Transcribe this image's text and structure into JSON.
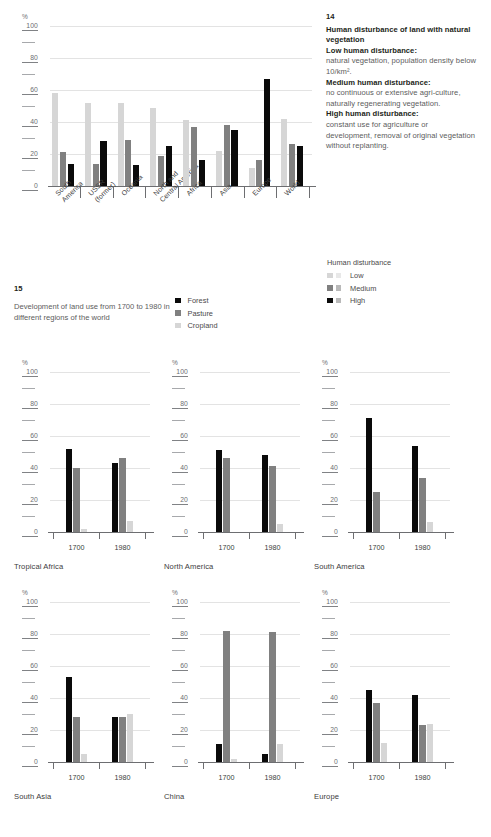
{
  "figure14": {
    "number": "14",
    "title": "Human disturbance of land with natural vegetation",
    "defs": [
      {
        "term": "Low human disturbance:",
        "text": "natural vegetation, population density below 10/km²."
      },
      {
        "term": "Medium human disturbance:",
        "text": "no continuous or extensive agri-culture, naturally regenerating vegetation."
      },
      {
        "term": "High human disturbance:",
        "text": "constant use for agriculture or development, removal of original vegetation without replanting."
      }
    ],
    "legend": {
      "title": "Human disturbance",
      "items": [
        {
          "label": "Low",
          "color": "#d6d6d6"
        },
        {
          "label": "Medium",
          "color": "#808080"
        },
        {
          "label": "High",
          "color": "#0a0a0a"
        }
      ]
    }
  },
  "figure15": {
    "number": "15",
    "caption": "Development of land use from 1700 to 1980 in different regions of the world",
    "legend": {
      "items": [
        {
          "label": "Forest",
          "color": "#0a0a0a"
        },
        {
          "label": "Pasture",
          "color": "#808080"
        },
        {
          "label": "Cropland",
          "color": "#d6d6d6"
        }
      ]
    }
  },
  "axis": {
    "unit": "%",
    "major_ticks": [
      "0",
      "20",
      "40",
      "60",
      "80",
      "100"
    ],
    "minor_ticks": [
      "10",
      "30",
      "50",
      "70",
      "90"
    ],
    "ylim": [
      0,
      100
    ]
  },
  "chart_data": [
    {
      "type": "bar",
      "id": "human-disturbance",
      "title": "Human disturbance of land with natural vegetation",
      "xlabel": "",
      "ylabel": "%",
      "ylim": [
        0,
        100
      ],
      "grid": true,
      "legend_position": "right",
      "categories": [
        "South America",
        "USSR (former)",
        "Oceania",
        "North and Central America",
        "Africa",
        "Asia",
        "Europe",
        "World"
      ],
      "series": [
        {
          "name": "Low",
          "color": "#d6d6d6",
          "values": [
            58,
            52,
            52,
            49,
            41,
            22,
            11,
            42
          ]
        },
        {
          "name": "Medium",
          "color": "#808080",
          "values": [
            21,
            14,
            29,
            19,
            37,
            38,
            16,
            26
          ]
        },
        {
          "name": "High",
          "color": "#0a0a0a",
          "values": [
            14,
            28,
            13,
            25,
            16,
            35,
            67,
            25
          ]
        }
      ]
    },
    {
      "type": "bar",
      "id": "tropical-africa",
      "title": "Tropical Africa",
      "ylabel": "%",
      "ylim": [
        0,
        100
      ],
      "categories": [
        "1700",
        "1980"
      ],
      "series": [
        {
          "name": "Forest",
          "color": "#0a0a0a",
          "values": [
            52,
            43
          ]
        },
        {
          "name": "Pasture",
          "color": "#808080",
          "values": [
            40,
            46
          ]
        },
        {
          "name": "Cropland",
          "color": "#d6d6d6",
          "values": [
            2,
            7
          ]
        }
      ]
    },
    {
      "type": "bar",
      "id": "north-america",
      "title": "North America",
      "ylabel": "%",
      "ylim": [
        0,
        100
      ],
      "categories": [
        "1700",
        "1980"
      ],
      "series": [
        {
          "name": "Forest",
          "color": "#0a0a0a",
          "values": [
            51,
            48
          ]
        },
        {
          "name": "Pasture",
          "color": "#808080",
          "values": [
            46,
            41
          ]
        },
        {
          "name": "Cropland",
          "color": "#d6d6d6",
          "values": [
            0,
            5
          ]
        }
      ]
    },
    {
      "type": "bar",
      "id": "south-america",
      "title": "South America",
      "ylabel": "%",
      "ylim": [
        0,
        100
      ],
      "categories": [
        "1700",
        "1980"
      ],
      "series": [
        {
          "name": "Forest",
          "color": "#0a0a0a",
          "values": [
            71,
            54
          ]
        },
        {
          "name": "Pasture",
          "color": "#808080",
          "values": [
            25,
            34
          ]
        },
        {
          "name": "Cropland",
          "color": "#d6d6d6",
          "values": [
            0,
            6
          ]
        }
      ]
    },
    {
      "type": "bar",
      "id": "south-asia",
      "title": "South Asia",
      "ylabel": "%",
      "ylim": [
        0,
        100
      ],
      "categories": [
        "1700",
        "1980"
      ],
      "series": [
        {
          "name": "Forest",
          "color": "#0a0a0a",
          "values": [
            53,
            28
          ]
        },
        {
          "name": "Pasture",
          "color": "#808080",
          "values": [
            28,
            28
          ]
        },
        {
          "name": "Cropland",
          "color": "#d6d6d6",
          "values": [
            5,
            30
          ]
        }
      ]
    },
    {
      "type": "bar",
      "id": "china",
      "title": "China",
      "ylabel": "%",
      "ylim": [
        0,
        100
      ],
      "categories": [
        "1700",
        "1980"
      ],
      "series": [
        {
          "name": "Forest",
          "color": "#0a0a0a",
          "values": [
            11,
            5
          ]
        },
        {
          "name": "Pasture",
          "color": "#808080",
          "values": [
            82,
            81
          ]
        },
        {
          "name": "Cropland",
          "color": "#d6d6d6",
          "values": [
            2,
            11
          ]
        }
      ]
    },
    {
      "type": "bar",
      "id": "europe",
      "title": "Europe",
      "ylabel": "%",
      "ylim": [
        0,
        100
      ],
      "categories": [
        "1700",
        "1980"
      ],
      "series": [
        {
          "name": "Forest",
          "color": "#0a0a0a",
          "values": [
            45,
            42
          ]
        },
        {
          "name": "Pasture",
          "color": "#808080",
          "values": [
            37,
            23
          ]
        },
        {
          "name": "Cropland",
          "color": "#d6d6d6",
          "values": [
            12,
            24
          ]
        }
      ]
    }
  ]
}
